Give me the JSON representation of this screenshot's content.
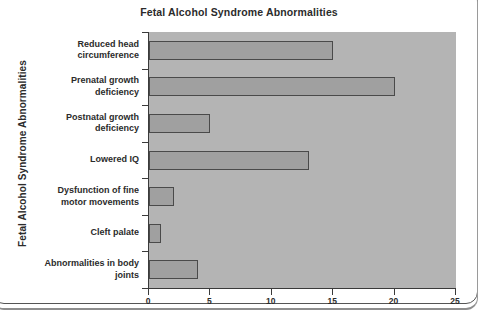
{
  "chart_data": {
    "type": "bar",
    "orientation": "horizontal",
    "title": "Fetal Alcohol Syndrome Abnormalities",
    "xlabel": "",
    "ylabel": "Fetal Alcohol Syndrome Abnormalities",
    "categories": [
      "Reduced head circumference",
      "Prenatal growth deficiency",
      "Postnatal growth deficiency",
      "Lowered IQ",
      "Dysfunction of fine motor movements",
      "Cleft palate",
      "Abnormalities in body joints"
    ],
    "values": [
      15,
      20,
      5,
      13,
      2,
      1,
      4
    ],
    "xlim": [
      0,
      25
    ],
    "xticks": [
      0,
      5,
      10,
      15,
      20,
      25
    ],
    "xtick_labels": [
      "0",
      "5",
      "10",
      "15",
      "20",
      "25"
    ],
    "grid": false,
    "legend": null,
    "colors": {
      "bar_fill": "#a0a0a0",
      "bar_stroke": "#4a4a4a",
      "plot_background": "#b4b4b4",
      "axis": "#3a3a3a",
      "text": "#2b2b2b",
      "page_background": "#ffffff"
    }
  }
}
